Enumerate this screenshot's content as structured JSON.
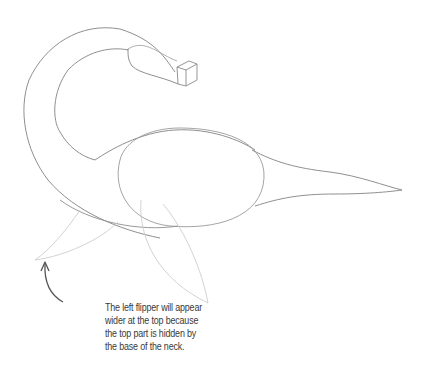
{
  "illustration": {
    "subject": "plesiosaur sketch",
    "parts": [
      "neck",
      "head-block",
      "body-oval",
      "tail",
      "left-flipper",
      "right-flipper"
    ]
  },
  "annotation": {
    "lines": [
      "The left flipper will appear",
      "wider at the top because",
      "the top part is hidden by",
      "the base of the neck."
    ]
  },
  "colors": {
    "stroke_dark": "#8a8a8a",
    "stroke_light": "#cfcfcf",
    "arrow": "#555555",
    "text": "#3a3a3a",
    "background": "#ffffff"
  }
}
